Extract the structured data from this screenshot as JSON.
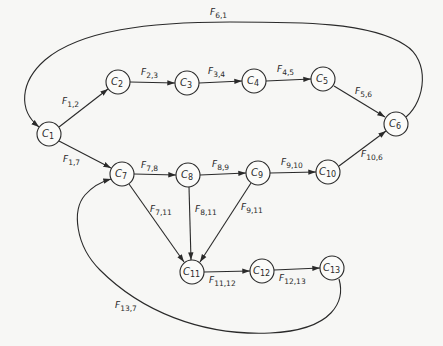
{
  "diagram": {
    "type": "directed-graph",
    "nodes": [
      {
        "id": "C1",
        "label": "C",
        "sub": "1",
        "x": 49,
        "y": 134
      },
      {
        "id": "C2",
        "label": "C",
        "sub": "2",
        "x": 118,
        "y": 82
      },
      {
        "id": "C3",
        "label": "C",
        "sub": "3",
        "x": 187,
        "y": 83
      },
      {
        "id": "C4",
        "label": "C",
        "sub": "4",
        "x": 254,
        "y": 81
      },
      {
        "id": "C5",
        "label": "C",
        "sub": "5",
        "x": 323,
        "y": 79
      },
      {
        "id": "C6",
        "label": "C",
        "sub": "6",
        "x": 396,
        "y": 124
      },
      {
        "id": "C7",
        "label": "C",
        "sub": "7",
        "x": 122,
        "y": 174
      },
      {
        "id": "C8",
        "label": "C",
        "sub": "8",
        "x": 188,
        "y": 175
      },
      {
        "id": "C9",
        "label": "C",
        "sub": "9",
        "x": 258,
        "y": 173
      },
      {
        "id": "C10",
        "label": "C",
        "sub": "10",
        "x": 328,
        "y": 172
      },
      {
        "id": "C11",
        "label": "C",
        "sub": "11",
        "x": 192,
        "y": 272
      },
      {
        "id": "C12",
        "label": "C",
        "sub": "12",
        "x": 262,
        "y": 271
      },
      {
        "id": "C13",
        "label": "C",
        "sub": "13",
        "x": 332,
        "y": 268
      }
    ],
    "edges": [
      {
        "from": "C1",
        "to": "C2",
        "label": "F",
        "sub": "1,2"
      },
      {
        "from": "C2",
        "to": "C3",
        "label": "F",
        "sub": "2,3"
      },
      {
        "from": "C3",
        "to": "C4",
        "label": "F",
        "sub": "3,4"
      },
      {
        "from": "C4",
        "to": "C5",
        "label": "F",
        "sub": "4,5"
      },
      {
        "from": "C5",
        "to": "C6",
        "label": "F",
        "sub": "5,6"
      },
      {
        "from": "C6",
        "to": "C1",
        "label": "F",
        "sub": "6,1"
      },
      {
        "from": "C1",
        "to": "C7",
        "label": "F",
        "sub": "1,7"
      },
      {
        "from": "C7",
        "to": "C8",
        "label": "F",
        "sub": "7,8"
      },
      {
        "from": "C8",
        "to": "C9",
        "label": "F",
        "sub": "8,9"
      },
      {
        "from": "C9",
        "to": "C10",
        "label": "F",
        "sub": "9,10"
      },
      {
        "from": "C10",
        "to": "C6",
        "label": "F",
        "sub": "10,6"
      },
      {
        "from": "C7",
        "to": "C11",
        "label": "F",
        "sub": "7,11"
      },
      {
        "from": "C8",
        "to": "C11",
        "label": "F",
        "sub": "8,11"
      },
      {
        "from": "C9",
        "to": "C11",
        "label": "F",
        "sub": "9,11"
      },
      {
        "from": "C11",
        "to": "C12",
        "label": "F",
        "sub": "11,12"
      },
      {
        "from": "C12",
        "to": "C13",
        "label": "F",
        "sub": "12,13"
      },
      {
        "from": "C13",
        "to": "C7",
        "label": "F",
        "sub": "13,7"
      }
    ]
  }
}
